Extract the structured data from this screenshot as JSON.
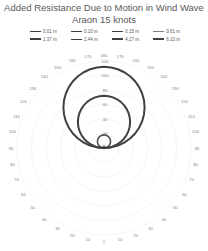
{
  "chart_data": {
    "type": "polar-line",
    "title": "Added Resistance Due to Motion in Wind Wave",
    "subtitle": "Araon 15 knots",
    "angular_axis": {
      "ticks_right": [
        0,
        10,
        20,
        30,
        40,
        50,
        60,
        70,
        80,
        90,
        100,
        110,
        120,
        130,
        140,
        150,
        160,
        170,
        180
      ],
      "ticks_left": [
        10,
        20,
        30,
        40,
        50,
        60,
        70,
        80,
        90,
        100,
        110,
        120,
        130,
        140,
        150,
        160,
        170
      ],
      "zero_at": "bottom",
      "symmetric": true
    },
    "radial_axis": {
      "ticks": [
        0,
        20,
        40,
        60,
        80,
        100,
        120
      ],
      "range": [
        0,
        120
      ]
    },
    "legend": {
      "position": "top",
      "entries": [
        "0.01 m",
        "0.10 m",
        "0.15 m",
        "0.61 m",
        "1.37 m",
        "2.44 m",
        "4.27 m",
        "6.10 m"
      ]
    },
    "series": [
      {
        "name": "0.01 m",
        "shape": "circle-through-origin",
        "max_radius_at_180": 0,
        "width": 1
      },
      {
        "name": "0.10 m",
        "shape": "circle-through-origin",
        "max_radius_at_180": 1,
        "width": 1
      },
      {
        "name": "0.15 m",
        "shape": "circle-through-origin",
        "max_radius_at_180": 2,
        "width": 1
      },
      {
        "name": "0.61 m",
        "shape": "circle-through-origin",
        "max_radius_at_180": 4,
        "width": 0.8
      },
      {
        "name": "1.37 m",
        "shape": "circle-through-origin",
        "max_radius_at_180": 18,
        "width": 1.5
      },
      {
        "name": "2.44 m",
        "shape": "circle-through-origin",
        "max_radius_at_180": 18,
        "width": 1
      },
      {
        "name": "4.27 m",
        "shape": "circle-through-origin",
        "max_radius_at_180": 72,
        "width": 2
      },
      {
        "name": "6.10 m",
        "shape": "circle-through-origin",
        "max_radius_at_180": 112,
        "width": 2
      }
    ]
  },
  "legend_rows": [
    [
      "0.01 m",
      "0.10 m",
      "0.15 m",
      "0.61 m"
    ],
    [
      "1.37 m",
      "2.44 m",
      "4.27 m",
      "6.10 m"
    ]
  ]
}
